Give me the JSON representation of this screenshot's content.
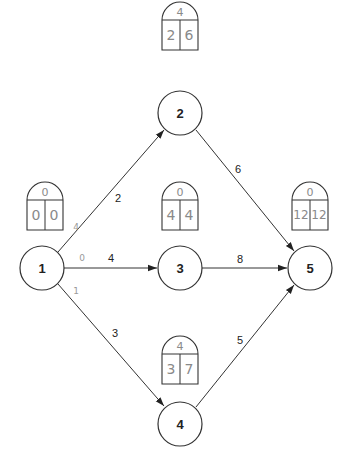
{
  "diagram": {
    "type": "activity-on-node network",
    "nodes": [
      {
        "id": "1",
        "label": "1",
        "cx": 42,
        "cy": 268,
        "r": 22
      },
      {
        "id": "2",
        "label": "2",
        "cx": 180,
        "cy": 113,
        "r": 22
      },
      {
        "id": "3",
        "label": "3",
        "cx": 180,
        "cy": 268,
        "r": 22
      },
      {
        "id": "4",
        "label": "4",
        "cx": 180,
        "cy": 424,
        "r": 22
      },
      {
        "id": "5",
        "label": "5",
        "cx": 310,
        "cy": 268,
        "r": 22
      }
    ],
    "edges": [
      {
        "from": "1",
        "to": "2",
        "label": "2"
      },
      {
        "from": "1",
        "to": "3",
        "label": "4"
      },
      {
        "from": "1",
        "to": "4",
        "label": "3"
      },
      {
        "from": "2",
        "to": "5",
        "label": "6"
      },
      {
        "from": "3",
        "to": "5",
        "label": "8"
      },
      {
        "from": "4",
        "to": "5",
        "label": "5"
      }
    ],
    "time_boxes": [
      {
        "node": "1",
        "slack": "0",
        "earliest": "0",
        "latest": "0"
      },
      {
        "node": "2",
        "slack": "4",
        "earliest": "2",
        "latest": "6"
      },
      {
        "node": "3",
        "slack": "0",
        "earliest": "4",
        "latest": "4"
      },
      {
        "node": "4",
        "slack": "4",
        "earliest": "3",
        "latest": "7"
      },
      {
        "node": "5",
        "slack": "0",
        "earliest": "12",
        "latest": "12"
      }
    ],
    "handwritten_edge_notes": [
      {
        "edge": "1-2",
        "text": "4"
      },
      {
        "edge": "1-3",
        "text": "0"
      },
      {
        "edge": "1-4",
        "text": "1"
      }
    ]
  }
}
